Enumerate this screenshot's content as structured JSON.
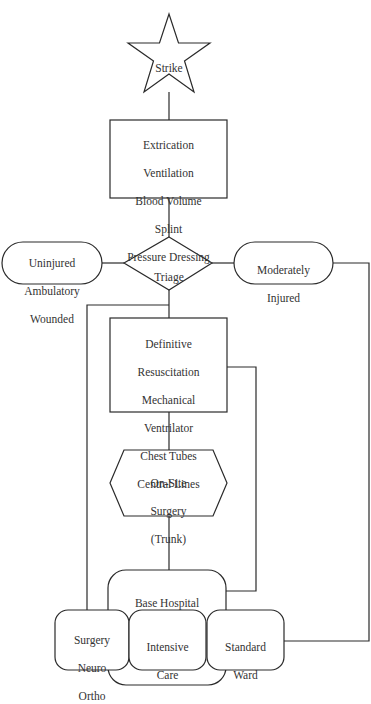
{
  "diagram": {
    "type": "flowchart",
    "line_color": "#2a2a2a",
    "background": "#ffffff",
    "nodes": {
      "strike": {
        "shape": "star",
        "label": "Strike"
      },
      "field_care": {
        "shape": "rectangle",
        "lines": [
          "Extrication",
          "Ventilation",
          "Blood Volume",
          "Splint",
          "Pressure Dressing"
        ]
      },
      "triage": {
        "shape": "diamond",
        "label": "Triage"
      },
      "uninjured": {
        "shape": "rounded-pill",
        "lines": [
          "Uninjured",
          "Ambulatory",
          "Wounded"
        ]
      },
      "moderately": {
        "shape": "rounded-pill",
        "lines": [
          "Moderately",
          "Injured"
        ]
      },
      "definitive": {
        "shape": "rectangle",
        "lines": [
          "Definitive",
          "Resuscitation",
          "Mechanical",
          "Ventrilator",
          "Chest Tubes",
          "Central Lines"
        ]
      },
      "onsite": {
        "shape": "hexagon",
        "lines": [
          "On-Site",
          "Surgery",
          "(Trunk)"
        ]
      },
      "base_hospital": {
        "shape": "rounded-rectangle",
        "label": "Base Hospital"
      },
      "surgery": {
        "shape": "rounded-rectangle",
        "lines": [
          "Surgery",
          "Neuro",
          "Ortho"
        ]
      },
      "intensive": {
        "shape": "rounded-rectangle",
        "lines": [
          "Intensive",
          "Care"
        ]
      },
      "standard": {
        "shape": "rounded-rectangle",
        "lines": [
          "Standard",
          "Ward"
        ]
      }
    },
    "edges": [
      {
        "from": "strike",
        "to": "field_care"
      },
      {
        "from": "field_care",
        "to": "triage"
      },
      {
        "from": "triage",
        "to": "uninjured"
      },
      {
        "from": "triage",
        "to": "moderately"
      },
      {
        "from": "triage",
        "to": "definitive"
      },
      {
        "from": "triage",
        "to": "surgery"
      },
      {
        "from": "moderately",
        "to": "standard"
      },
      {
        "from": "definitive",
        "to": "onsite"
      },
      {
        "from": "definitive",
        "to": "base_hospital"
      },
      {
        "from": "onsite",
        "to": "base_hospital"
      }
    ]
  }
}
